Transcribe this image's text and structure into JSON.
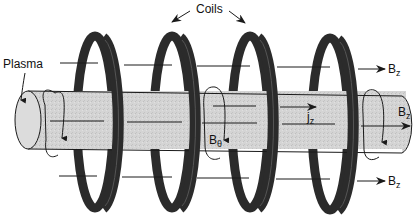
{
  "labels": {
    "coils": "Coils",
    "plasma": "Plasma",
    "bz_top": {
      "main": "B",
      "sub": "z"
    },
    "bz_axis": {
      "main": "B",
      "sub": "z"
    },
    "bz_bottom": {
      "main": "B",
      "sub": "z"
    },
    "jz": {
      "main": "j",
      "sub": "z"
    },
    "btheta": {
      "main": "B",
      "sub": "θ"
    }
  },
  "colors": {
    "coil": "#2b2b2b",
    "coil_highlight": "#4a4a4a",
    "plasma_fill": "#d2d2d2",
    "line": "#1a1a1a",
    "background": "#ffffff"
  }
}
